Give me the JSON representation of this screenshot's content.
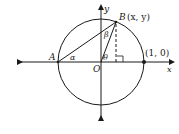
{
  "diagram": {
    "labels": {
      "y_axis": "y",
      "x_axis": "x",
      "point_b": "B",
      "point_b_coords": "(x, y)",
      "point_a": "A",
      "origin": "O",
      "unit_point": "(1, 0)",
      "alpha": "α",
      "beta": "β",
      "theta": "θ"
    },
    "colors": {
      "stroke": "#1a1a1a",
      "background": "#ffffff"
    }
  }
}
